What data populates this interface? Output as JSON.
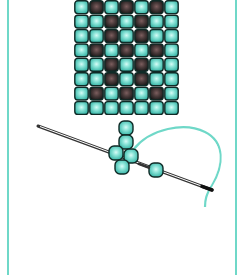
{
  "colors": {
    "frame": "#6fd8c8",
    "bead_teal_light": "#b8f4ec",
    "bead_teal_mid": "#5fd2c4",
    "bead_teal_dark": "#2aa899",
    "bead_dark_light": "#7a5a5a",
    "bead_dark_edge": "#1a1a1a",
    "bead_outline": "#0f2a26",
    "thread": "#6fd8c8",
    "needle": "#333333"
  },
  "grid": {
    "columns": 7,
    "rows": 8,
    "origin_x": 74,
    "origin_y": 0,
    "cell_w": 15,
    "cell_h": 14.4,
    "pattern": [
      "TDTDTDT",
      "TTDTDTT",
      "TTDTDTT",
      "TDTDTDT",
      "TTDTDTT",
      "TTDTDTT",
      "TDTDTDT",
      "TTTTTTT"
    ]
  },
  "loose_beads": [
    {
      "name": "stack-bead-1",
      "x": 126,
      "y": 128
    },
    {
      "name": "stack-bead-2",
      "x": 126,
      "y": 142
    },
    {
      "name": "cluster-bead-left",
      "x": 116,
      "y": 153
    },
    {
      "name": "cluster-bead-right",
      "x": 131,
      "y": 156
    },
    {
      "name": "cluster-bead-bottom",
      "x": 122,
      "y": 167
    },
    {
      "name": "needle-bead",
      "x": 156,
      "y": 170
    }
  ],
  "needle": {
    "x1": 38,
    "y1": 126,
    "x2": 212,
    "y2": 190
  },
  "thread_path": "M133,150 C150,128 185,122 205,132 C225,142 224,165 212,185 C206,195 205,200 205,207"
}
